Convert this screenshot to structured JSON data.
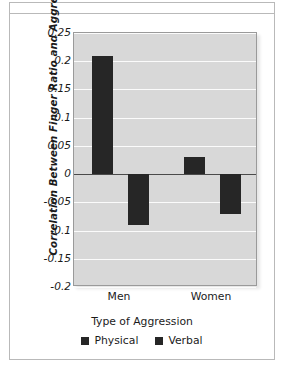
{
  "chart_data": {
    "type": "bar",
    "title": "",
    "subtitle": "",
    "xlabel": "Type of Aggression",
    "ylabel": "Correlation Between Finger Ratio and Aggression",
    "categories": [
      "Men",
      "Women"
    ],
    "series": [
      {
        "name": "Physical",
        "values": [
          0.21,
          0.03
        ],
        "color": "#262626"
      },
      {
        "name": "Verbal",
        "values": [
          -0.09,
          -0.07
        ],
        "color": "#262626"
      }
    ],
    "ylim": [
      -0.2,
      0.25
    ],
    "ytick_values": [
      0.25,
      0.2,
      0.15,
      0.1,
      0.05,
      0,
      -0.05,
      -0.1,
      -0.15,
      -0.2
    ],
    "ytick_labels": [
      "0.25",
      "0.2",
      "0.15",
      "0.1",
      "0.05",
      "0",
      "-0.05",
      "-0.1",
      "-0.15",
      "-0.2"
    ],
    "grid": true,
    "gridline_color": "#fbfbfb",
    "zero_line": true,
    "legend_position": "bottom",
    "plot_background": "#d8d8d8",
    "figure_background": "#ffffff"
  },
  "legend": {
    "entries": [
      {
        "label": "Physical"
      },
      {
        "label": "Verbal"
      }
    ]
  },
  "axes": {
    "x_title": "Type of Aggression",
    "y_title": "Correlation Between Finger Ratio and Aggression"
  }
}
